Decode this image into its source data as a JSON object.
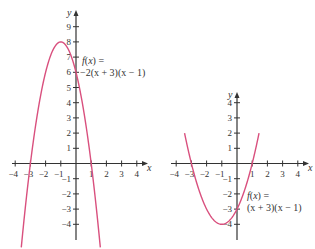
{
  "chart_data": [
    {
      "type": "line",
      "title": "",
      "function_label_line1": "f(x) =",
      "function_label_line2": "−2(x + 3)(x − 1)",
      "expression": "-2(x+3)(x-1)",
      "coeff": -2,
      "roots": [
        -3,
        1
      ],
      "vertex": [
        -1,
        8
      ],
      "y_intercept": 6,
      "xlabel": "x",
      "ylabel": "y",
      "xlim": [
        -4,
        4
      ],
      "ylim": [
        -4,
        9
      ],
      "x_ticks": [
        -4,
        -3,
        -2,
        -1,
        1,
        2,
        3,
        4
      ],
      "y_ticks": [
        -4,
        -3,
        -2,
        -1,
        1,
        2,
        3,
        4,
        5,
        6,
        7,
        8,
        9
      ],
      "curve_x_range": [
        -3.6,
        1.6
      ],
      "grid": false,
      "color": "#d9507e",
      "layout": {
        "origin_px": [
          76,
          163.5
        ],
        "unit_px": 15.2,
        "x_axis_px": [
          12,
          148
        ],
        "y_axis_px": [
          10,
          240
        ],
        "label_px": [
          82,
          64
        ]
      }
    },
    {
      "type": "line",
      "title": "",
      "function_label_line1": "f(x) =",
      "function_label_line2": "(x + 3)(x − 1)",
      "expression": "(x+3)(x-1)",
      "coeff": 1,
      "roots": [
        -3,
        1
      ],
      "vertex": [
        -1,
        -4
      ],
      "y_intercept": -3,
      "xlabel": "x",
      "ylabel": "y",
      "xlim": [
        -4,
        4
      ],
      "ylim": [
        -4,
        4
      ],
      "x_ticks": [
        -4,
        -3,
        -2,
        -1,
        1,
        2,
        3,
        4
      ],
      "y_ticks": [
        -4,
        -3,
        -2,
        -1,
        1,
        2,
        3,
        4
      ],
      "curve_x_range": [
        -3.45,
        1.45
      ],
      "grid": false,
      "color": "#d9507e",
      "layout": {
        "origin_px": [
          237,
          163.5
        ],
        "unit_px": 15.2,
        "x_axis_px": [
          171,
          309
        ],
        "y_axis_px": [
          92,
          240
        ],
        "label_px": [
          247,
          199
        ]
      }
    }
  ]
}
